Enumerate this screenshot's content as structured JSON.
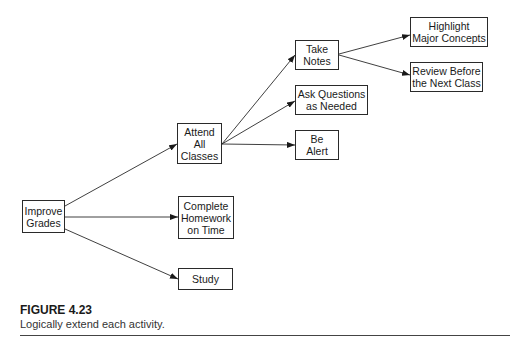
{
  "diagram": {
    "type": "tree",
    "nodes": [
      {
        "id": "improve",
        "label": "Improve\nGrades",
        "box": [
          22,
          200,
          43,
          33
        ]
      },
      {
        "id": "attend",
        "label": "Attend\nAll\nClasses",
        "box": [
          177,
          123,
          45,
          41
        ]
      },
      {
        "id": "homework",
        "label": "Complete\nHomework\non Time",
        "box": [
          178,
          196,
          56,
          43
        ]
      },
      {
        "id": "study",
        "label": "Study",
        "box": [
          178,
          268,
          55,
          22
        ]
      },
      {
        "id": "notes",
        "label": "Take\nNotes",
        "box": [
          295,
          40,
          44,
          30
        ]
      },
      {
        "id": "ask",
        "label": "Ask Questions\nas Needed",
        "box": [
          295,
          85,
          73,
          30
        ]
      },
      {
        "id": "alert",
        "label": "Be\nAlert",
        "box": [
          295,
          130,
          44,
          30
        ]
      },
      {
        "id": "highlight",
        "label": "Highlight\nMajor Concepts",
        "box": [
          410,
          17,
          78,
          30
        ]
      },
      {
        "id": "review",
        "label": "Review Before\nthe Next Class",
        "box": [
          410,
          62,
          73,
          30
        ]
      }
    ],
    "edges": [
      {
        "from": "improve",
        "to": "attend",
        "line": [
          65,
          206,
          177,
          144
        ]
      },
      {
        "from": "improve",
        "to": "homework",
        "line": [
          65,
          217,
          178,
          217
        ]
      },
      {
        "from": "improve",
        "to": "study",
        "line": [
          65,
          229,
          178,
          279
        ]
      },
      {
        "from": "attend",
        "to": "notes",
        "line": [
          222,
          144,
          295,
          55
        ]
      },
      {
        "from": "attend",
        "to": "ask",
        "line": [
          222,
          144,
          295,
          101
        ]
      },
      {
        "from": "attend",
        "to": "alert",
        "line": [
          222,
          144,
          295,
          145
        ]
      },
      {
        "from": "notes",
        "to": "highlight",
        "line": [
          339,
          54,
          410,
          35
        ]
      },
      {
        "from": "notes",
        "to": "review",
        "line": [
          339,
          55,
          410,
          75
        ]
      }
    ]
  },
  "caption": {
    "title": "FIGURE 4.23",
    "text": "Logically extend each activity."
  }
}
